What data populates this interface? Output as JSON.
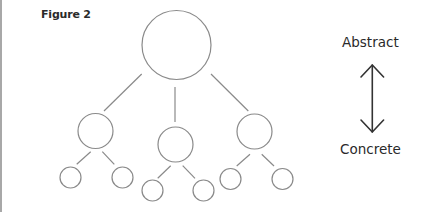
{
  "figure": {
    "label": "Figure 2"
  },
  "scale": {
    "top_label": "Abstract",
    "bottom_label": "Concrete",
    "arrow": "double-headed-vertical-arrow"
  },
  "tree": {
    "levels": 3,
    "root": {
      "id": "root",
      "children": [
        {
          "id": "mid-left",
          "children": [
            "leaf-1",
            "leaf-2"
          ]
        },
        {
          "id": "mid-center",
          "children": [
            "leaf-3",
            "leaf-4"
          ]
        },
        {
          "id": "mid-right",
          "children": [
            "leaf-5",
            "leaf-6"
          ]
        }
      ]
    }
  },
  "colors": {
    "stroke": "#8a8a8a",
    "arrow": "#333333",
    "text": "#2a2a2a",
    "background": "#ffffff"
  }
}
